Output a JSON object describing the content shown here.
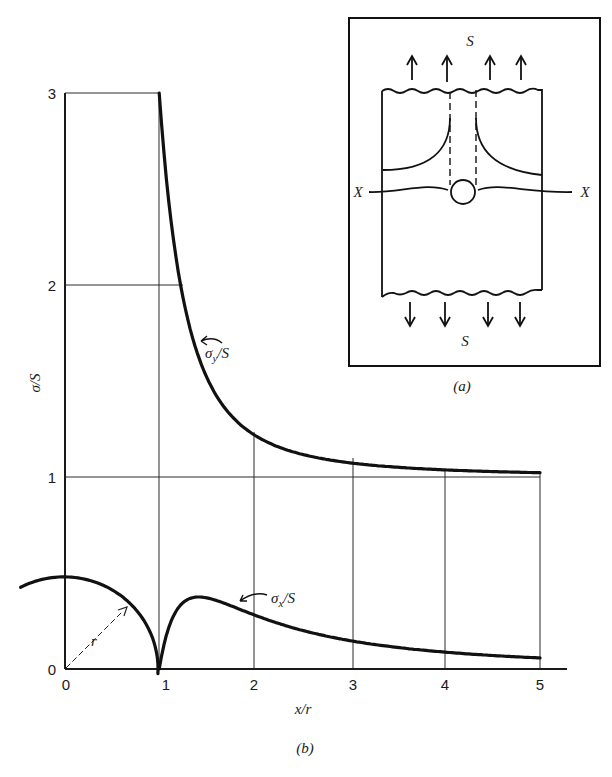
{
  "figure": {
    "panel_a_label": "(a)",
    "panel_b_label": "(b)"
  },
  "inset": {
    "top_load_label": "S",
    "bottom_load_label": "S",
    "section_left_label": "X",
    "section_right_label": "X"
  },
  "annotations": {
    "sigma_y_label": "σ",
    "sigma_y_sub": "y",
    "sigma_y_suffix": "/S",
    "sigma_x_label": "σ",
    "sigma_x_sub": "x",
    "sigma_x_suffix": "/S",
    "radius_label": "r"
  },
  "chart_data": {
    "type": "line",
    "title": "",
    "xlabel": "x/r",
    "ylabel": "σ/S",
    "xlim": [
      0,
      5
    ],
    "ylim": [
      0,
      3
    ],
    "x_ticks": [
      "0",
      "1",
      "2",
      "3",
      "4",
      "5"
    ],
    "y_ticks": [
      "0",
      "1",
      "2",
      "3"
    ],
    "grid": true,
    "series": [
      {
        "name": "σy/S",
        "x": [
          1.0,
          1.1,
          1.24,
          1.5,
          2.0,
          2.5,
          3.0,
          4.0,
          5.0
        ],
        "values": [
          3.0,
          2.44,
          1.96,
          1.52,
          1.22,
          1.12,
          1.07,
          1.04,
          1.02
        ]
      },
      {
        "name": "σx/S",
        "x": [
          1.0,
          1.2,
          1.41,
          1.5,
          2.0,
          2.5,
          3.0,
          4.0,
          5.0
        ],
        "values": [
          0.0,
          0.32,
          0.375,
          0.37,
          0.28,
          0.2,
          0.15,
          0.09,
          0.06
        ]
      }
    ],
    "hole_radius_marker": {
      "label": "r",
      "center_x": 0,
      "radius": 1
    }
  }
}
